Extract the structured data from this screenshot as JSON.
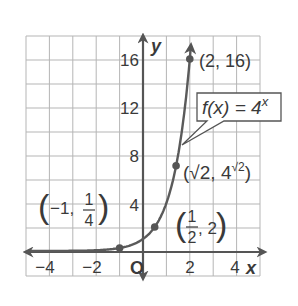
{
  "chart_data": {
    "type": "line",
    "title": "",
    "function_label": "f(x) = 4^x",
    "function_label_parts": {
      "lhs": "f(x) = 4",
      "exp": "x"
    },
    "xlabel": "x",
    "ylabel": "y",
    "origin_label": "O",
    "xlim": [
      -5,
      5
    ],
    "ylim": [
      -2,
      18
    ],
    "grid": true,
    "x_ticks": [
      -4,
      -2,
      2,
      4
    ],
    "x_tick_labels": [
      "−4",
      "−2",
      "2",
      "4"
    ],
    "y_ticks": [
      4,
      8,
      12,
      16
    ],
    "y_tick_labels": [
      "4",
      "8",
      "12",
      "16"
    ],
    "series": [
      {
        "name": "f(x) = 4^x",
        "x": [
          -5,
          -4,
          -3,
          -2,
          -1,
          -0.5,
          0,
          0.5,
          1,
          1.414,
          1.75,
          2,
          2.05
        ],
        "values": [
          0.001,
          0.004,
          0.016,
          0.0625,
          0.25,
          0.5,
          1,
          2,
          4,
          7.1,
          11.3,
          16,
          17.1
        ]
      }
    ],
    "points": [
      {
        "x": -1,
        "y": 0.25,
        "label": "(−1, 1/4)"
      },
      {
        "x": 0.5,
        "y": 2,
        "label": "(1/2, 2)"
      },
      {
        "x": 1.414,
        "y": 7.1,
        "label": "(√2, 4^√2)"
      },
      {
        "x": 2,
        "y": 16,
        "label": "(2, 16)"
      }
    ]
  },
  "labels": {
    "p_neg1": {
      "open": "(",
      "a": "−1,",
      "num": "1",
      "den": "4",
      "close": ")"
    },
    "p_half": {
      "open": "(",
      "num": "1",
      "den": "2",
      "b": ", 2",
      "close": ")"
    },
    "p_sqrt2": {
      "text": "(√2, 4",
      "sup": "√2",
      "close": ")"
    },
    "p_2": {
      "text": "(2, 16)"
    }
  }
}
